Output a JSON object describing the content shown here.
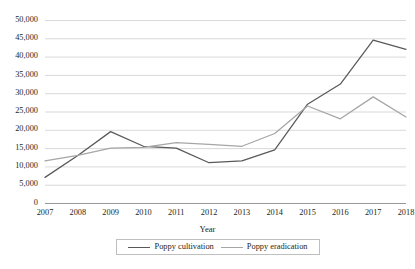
{
  "chart_data": {
    "type": "line",
    "title": "",
    "xlabel": "Year",
    "ylabel": "",
    "grid": true,
    "legend_position": "bottom",
    "x": [
      2007,
      2008,
      2009,
      2010,
      2011,
      2012,
      2013,
      2014,
      2015,
      2016,
      2017,
      2018
    ],
    "categories": [
      "2007",
      "2008",
      "2009",
      "2010",
      "2011",
      "2012",
      "2013",
      "2014",
      "2015",
      "2016",
      "2017",
      "2018"
    ],
    "ylim": [
      0,
      50000
    ],
    "yticks": [
      0,
      5000,
      10000,
      15000,
      20000,
      25000,
      30000,
      35000,
      40000,
      45000,
      50000
    ],
    "ytick_labels": [
      "0",
      "5,000",
      "10,000",
      "15,000",
      "20,000",
      "25,000",
      "30,000",
      "35,000",
      "40,000",
      "45,000",
      "50,000"
    ],
    "series": [
      {
        "name": "Poppy cultivation",
        "color": "#595959",
        "values": [
          7000,
          13000,
          19500,
          15500,
          15000,
          11000,
          11500,
          14500,
          27000,
          32500,
          44500,
          42000
        ]
      },
      {
        "name": "Poppy eradication",
        "color": "#a6a6a6",
        "values": [
          11500,
          13000,
          15000,
          15200,
          16500,
          16000,
          15500,
          19000,
          26500,
          23000,
          29000,
          23500
        ]
      }
    ]
  },
  "legend": {
    "items": [
      {
        "label": "Poppy cultivation",
        "color": "#595959"
      },
      {
        "label": "Poppy eradication",
        "color": "#a6a6a6"
      }
    ]
  },
  "axes": {
    "x_title": "Year"
  }
}
